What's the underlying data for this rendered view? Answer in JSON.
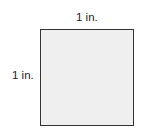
{
  "diagram": {
    "shape": "square",
    "fill_color": "#efefef",
    "border_color": "#333333",
    "labels": {
      "top": "1 in.",
      "left": "1 in."
    }
  }
}
